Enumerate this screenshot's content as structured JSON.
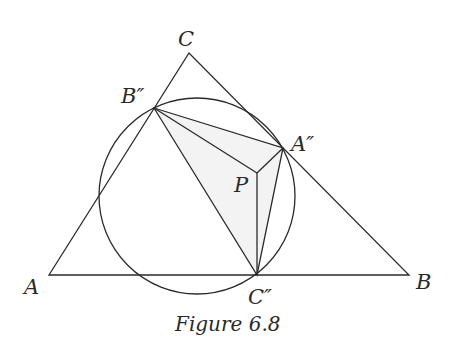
{
  "figure": {
    "caption": "Figure 6.8",
    "stroke_color": "#2a2a2a",
    "shade_color": "#f2f2f2"
  },
  "points": {
    "A": {
      "label": "A",
      "x": 49,
      "y": 275
    },
    "B": {
      "label": "B",
      "x": 409,
      "y": 275
    },
    "C": {
      "label": "C",
      "x": 189,
      "y": 53
    },
    "A2": {
      "label": "A″",
      "x": 283,
      "y": 148
    },
    "B2": {
      "label": "B″",
      "x": 154,
      "y": 108
    },
    "C2": {
      "label": "C″",
      "x": 257,
      "y": 275
    },
    "P": {
      "label": "P",
      "x": 257,
      "y": 173
    }
  },
  "circle": {
    "cx": 197,
    "cy": 196,
    "r": 98
  },
  "labels": {
    "A": "A",
    "B": "B",
    "C": "C",
    "A2": "A″",
    "B2": "B″",
    "C2": "C″",
    "P": "P"
  }
}
